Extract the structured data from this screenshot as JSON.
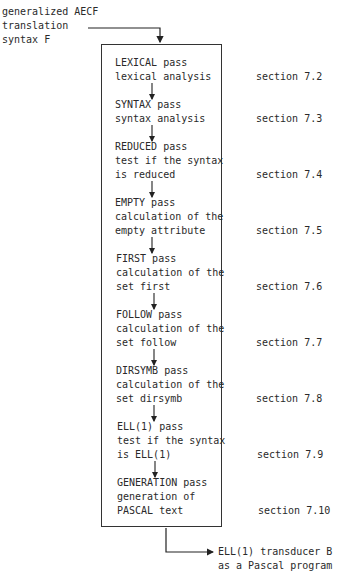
{
  "input": {
    "lines": [
      "generalized AECF",
      "translation",
      "syntax F"
    ]
  },
  "passes": [
    {
      "lines": [
        "LEXICAL pass",
        "lexical analysis"
      ],
      "section": "section 7.2"
    },
    {
      "lines": [
        "SYNTAX pass",
        "syntax analysis"
      ],
      "section": "section 7.3"
    },
    {
      "lines": [
        "REDUCED pass",
        "test if the syntax",
        "is reduced"
      ],
      "section": "section 7.4"
    },
    {
      "lines": [
        "EMPTY pass",
        "calculation of the",
        "empty attribute"
      ],
      "section": "section 7.5"
    },
    {
      "lines": [
        "FIRST pass",
        "calculation of the",
        "set first"
      ],
      "section": "section 7.6"
    },
    {
      "lines": [
        "FOLLOW pass",
        "calculation of the",
        "set follow"
      ],
      "section": "section 7.7"
    },
    {
      "lines": [
        "DIRSYMB pass",
        "calculation of the",
        "set dirsymb"
      ],
      "section": "section 7.8"
    },
    {
      "lines": [
        "ELL(1) pass",
        "test if the syntax",
        "is ELL(1)"
      ],
      "section": "section 7.9"
    },
    {
      "lines": [
        "GENERATION pass",
        "generation of",
        "PASCAL text"
      ],
      "section": "section 7.10"
    }
  ],
  "output": {
    "lines": [
      "ELL(1) transducer B",
      "as a Pascal program"
    ]
  }
}
